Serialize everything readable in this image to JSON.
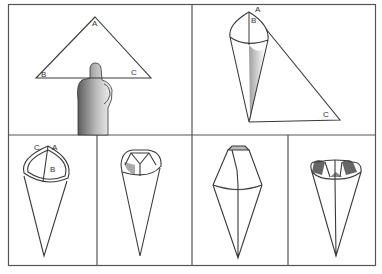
{
  "figure": {
    "panel_count": 6,
    "colors": {
      "ink": "#3a3a3a",
      "frame": "#555555",
      "shade": "#9a9a9a",
      "paper": "#ffffff"
    }
  },
  "panels": [
    {
      "id": "step-1",
      "labels": {
        "a": "A",
        "b": "B",
        "c": "C"
      }
    },
    {
      "id": "step-2",
      "labels": {
        "a": "A",
        "b": "B",
        "c": "C"
      }
    },
    {
      "id": "step-3",
      "labels": {
        "c": "C",
        "a": "A",
        "b": "B"
      }
    },
    {
      "id": "step-4",
      "labels": {}
    },
    {
      "id": "step-5",
      "labels": {}
    },
    {
      "id": "step-6",
      "labels": {}
    }
  ]
}
